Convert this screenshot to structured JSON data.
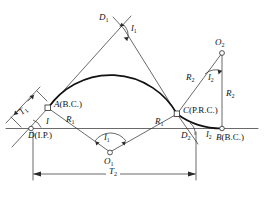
{
  "diagram": {
    "type": "engineering-survey-diagram",
    "background_color": "#ffffff",
    "line_color": "#2a2a2a",
    "curve_color": "#111111",
    "labels": {
      "point_a": "A",
      "point_a_paren": "(B.C.)",
      "point_b": "B",
      "point_b_paren": "(B.C.)",
      "point_c": "C",
      "point_c_paren": "(P.R.C.)",
      "point_d": "D",
      "point_d_paren": "(I.P.)",
      "point_d1": "D",
      "point_d1_sub": "1",
      "point_d2": "D",
      "point_d2_sub": "2",
      "center_o1": "O",
      "center_o1_sub": "1",
      "center_o2": "O",
      "center_o2_sub": "2",
      "tangent_t1": "T",
      "tangent_t1_sub": "1",
      "tangent_t2": "T",
      "tangent_t2_sub": "2",
      "radius_r1_left": "R",
      "radius_r1_left_sub": "1",
      "radius_r1_right": "R",
      "radius_r1_right_sub": "1",
      "radius_r2_slant": "R",
      "radius_r2_slant_sub": "2",
      "radius_r2_vertical": "R",
      "radius_r2_vertical_sub": "2",
      "angle_i": "I",
      "angle_i1_top": "I",
      "angle_i1_top_sub": "1",
      "angle_i1_bottom": "I",
      "angle_i1_bottom_sub": "1",
      "angle_i2_upper": "I",
      "angle_i2_upper_sub": "2",
      "angle_i2_lower": "I",
      "angle_i2_lower_sub": "2"
    }
  }
}
